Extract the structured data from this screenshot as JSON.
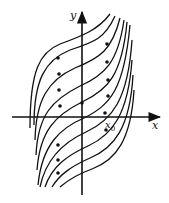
{
  "diagram": {
    "type": "phase-portrait",
    "axes": {
      "x_label": "x",
      "y_label": "y",
      "marked_point": {
        "label": "x",
        "subscript": "0"
      }
    },
    "colors": {
      "stroke": "#111111",
      "background": "#ffffff"
    },
    "trajectory_count": 10
  }
}
